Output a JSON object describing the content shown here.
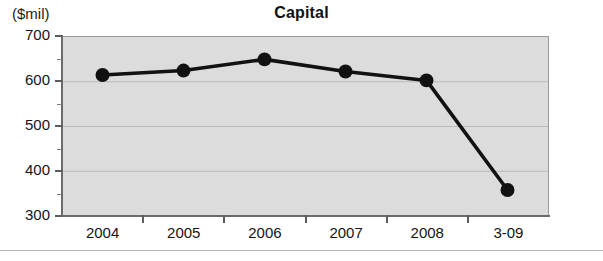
{
  "chart_data": {
    "type": "line",
    "title": "Capital",
    "subtitle": "",
    "unit_label": "($mil)",
    "xlabel": "",
    "ylabel": "($mil)",
    "categories": [
      "2004",
      "2005",
      "2006",
      "2007",
      "2008",
      "3-09"
    ],
    "values": [
      615,
      625,
      650,
      623,
      603,
      358
    ],
    "series": [
      {
        "name": "Capital",
        "values": [
          615,
          625,
          650,
          623,
          603,
          358
        ],
        "color": "#111111",
        "marker": "circle"
      }
    ],
    "ylim": [
      300,
      700
    ],
    "ytick_labels": [
      "300",
      "400",
      "500",
      "600",
      "700"
    ],
    "ytick_values": [
      300,
      400,
      500,
      600,
      700
    ],
    "yminor_values": [
      350,
      450,
      550,
      650
    ],
    "xlim_categories": 6,
    "grid": true,
    "grid_axis": "y",
    "legend": "none",
    "plot_background": "#dcdcdc",
    "line_color": "#111111",
    "marker_color": "#111111",
    "axis_color": "#6b6b6b"
  }
}
